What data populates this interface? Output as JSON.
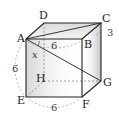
{
  "figure": {
    "type": "cube",
    "vertices": {
      "A": "A",
      "B": "B",
      "C": "C",
      "D": "D",
      "E": "E",
      "F": "F",
      "G": "G",
      "H": "H"
    },
    "dimensions": {
      "AB": "6",
      "AE": "6",
      "EF": "6",
      "BC_mark": "3"
    },
    "variable": "x",
    "colors": {
      "edge": "#222222",
      "hidden_edge": "#777777",
      "face_shade": "#cfcfcf"
    }
  }
}
